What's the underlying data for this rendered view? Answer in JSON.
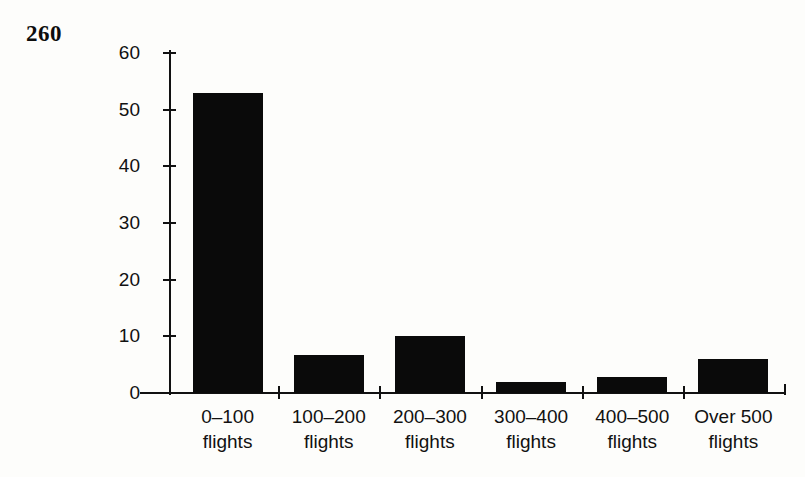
{
  "page": {
    "number": "260",
    "background_color": "#fdfdfb",
    "ink_color": "#111111"
  },
  "chart_data": {
    "type": "bar",
    "title": "",
    "subtitle": "",
    "xlabel": "",
    "ylabel": "",
    "categories": [
      "0–100 flights",
      "100–200 flights",
      "200–300 flights",
      "300–400 flights",
      "400–500 flights",
      "Over 500 flights"
    ],
    "category_lines": [
      [
        "0–100",
        "flights"
      ],
      [
        "100–200",
        "flights"
      ],
      [
        "200–300",
        "flights"
      ],
      [
        "300–400",
        "flights"
      ],
      [
        "400–500",
        "flights"
      ],
      [
        "Over 500",
        "flights"
      ]
    ],
    "values": [
      53,
      6.7,
      10,
      2,
      2.8,
      6
    ],
    "ylim": [
      0,
      60
    ],
    "yticks": [
      0,
      10,
      20,
      30,
      40,
      50,
      60
    ],
    "ytick_labels": [
      "0",
      "10",
      "20",
      "30",
      "40",
      "50",
      "60"
    ],
    "grid": false,
    "legend": "none",
    "bar_color": "#0a0a0a",
    "bar_count": 6
  },
  "axes": {
    "y_tick_labels": [
      "60",
      "50",
      "40",
      "30",
      "20",
      "10",
      "0"
    ],
    "y_max_label": "60",
    "y_min_label": "0"
  }
}
